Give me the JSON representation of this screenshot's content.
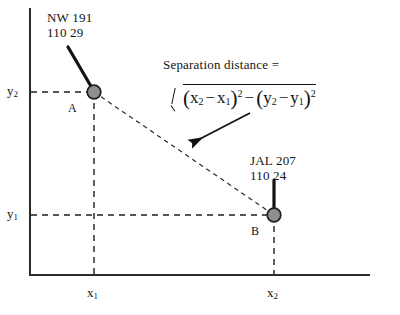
{
  "figure": {
    "background_color": "#ffffff",
    "axis_color": "#2b2b2b",
    "node_fill_color": "#8f8f8f",
    "node_stroke_color": "#1f1f1f",
    "dash_color": "#1f1f1f"
  },
  "callouts": {
    "a": {
      "line1": "NW 191",
      "line2": "110  29"
    },
    "b": {
      "line1": "JAL 207",
      "line2": "110  24"
    }
  },
  "points": {
    "a": {
      "label": "A",
      "x": 94,
      "y": 92
    },
    "b": {
      "label": "B",
      "x": 274,
      "y": 215
    }
  },
  "annotation": {
    "separation_label": "Separation distance =",
    "formula_plain": "sqrt((x2 - x1)^2 - (y2 - y1)^2)",
    "formula_parts": {
      "x2": "x",
      "x2_sub": "2",
      "minus_inner_1": "−",
      "x1": "x",
      "x1_sub": "1",
      "sup_1": "2",
      "between_op": "−",
      "y2": "y",
      "y2_sub": "2",
      "minus_inner_2": "−",
      "y1": "y",
      "y1_sub": "1",
      "sup_2": "2",
      "open_paren": "(",
      "close_paren": ")"
    }
  },
  "axes": {
    "x_ticks": [
      {
        "label": "x",
        "sub": "1",
        "px": 94
      },
      {
        "label": "x",
        "sub": "2",
        "px": 274
      }
    ],
    "y_ticks": [
      {
        "label": "y",
        "sub": "2",
        "px": 92
      },
      {
        "label": "y",
        "sub": "1",
        "px": 215
      }
    ]
  }
}
